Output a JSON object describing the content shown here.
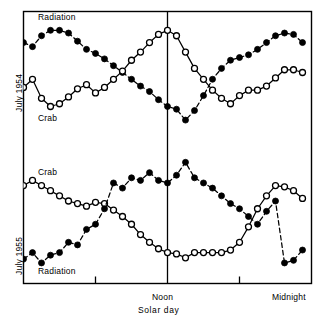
{
  "figure": {
    "xlabel": "Solar day",
    "axis_y_top": "July 1954",
    "axis_y_bottom": "July 1955",
    "tick_noon": "Noon",
    "tick_midnight": "Midnight",
    "label_radiation_1954": "Radiation",
    "label_crab_1954": "Crab",
    "label_crab_1955": "Crab",
    "label_radiation_1955": "Radiation",
    "colors": {
      "ink": "#000000",
      "background": "#ffffff"
    }
  },
  "chart_data": {
    "type": "line",
    "title": "",
    "subtitle": "",
    "xlabel": "Solar day",
    "ylabel": "",
    "grid": false,
    "legend": "inline-annotations",
    "xlim": [
      0,
      24
    ],
    "xticks": [
      6,
      12,
      18,
      24
    ],
    "xtick_labels": [
      "",
      "Noon",
      "",
      "Midnight"
    ],
    "noon_reference_line": 12,
    "panels": [
      {
        "name": "July 1954",
        "ylabel": "July 1954",
        "ylim": [
          0,
          100
        ],
        "series": [
          {
            "name": "Radiation",
            "marker": "filled-circle",
            "line": "dashed",
            "x": [
              0.0,
              0.75,
              1.5,
              2.25,
              3.0,
              3.75,
              4.5,
              5.25,
              6.0,
              6.75,
              7.5,
              8.25,
              9.0,
              9.75,
              10.5,
              11.25,
              12.0,
              12.75,
              13.5,
              14.25,
              15.0,
              15.75,
              16.5,
              17.25,
              18.0,
              18.75,
              19.5,
              20.25,
              21.0,
              21.75,
              22.5,
              23.25
            ],
            "y": [
              79,
              76,
              84,
              88,
              88,
              86,
              80,
              74,
              71,
              67,
              62,
              57,
              52,
              47,
              43,
              37,
              32,
              30,
              22,
              29,
              40,
              52,
              60,
              66,
              68,
              70,
              74,
              79,
              84,
              86,
              85,
              79
            ],
            "ylim": [
              0,
              100
            ]
          },
          {
            "name": "Crab",
            "marker": "open-circle",
            "line": "solid",
            "x": [
              0.0,
              0.75,
              1.5,
              2.25,
              3.0,
              3.75,
              4.5,
              5.25,
              6.0,
              6.75,
              7.5,
              8.25,
              9.0,
              9.75,
              10.5,
              11.25,
              12.0,
              12.75,
              13.5,
              14.25,
              15.0,
              15.75,
              16.5,
              17.25,
              18.0,
              18.75,
              19.5,
              20.25,
              21.0,
              21.75,
              22.5,
              23.25
            ],
            "y": [
              46,
              52,
              38,
              32,
              34,
              39,
              45,
              48,
              42,
              46,
              52,
              58,
              66,
              72,
              79,
              85,
              88,
              84,
              72,
              60,
              52,
              44,
              38,
              34,
              40,
              44,
              44,
              47,
              53,
              59,
              59,
              57
            ],
            "ylim": [
              0,
              100
            ]
          }
        ]
      },
      {
        "name": "July 1955",
        "ylabel": "July 1955",
        "ylim": [
          0,
          100
        ],
        "series": [
          {
            "name": "Crab",
            "marker": "open-circle",
            "line": "solid",
            "x": [
              0.0,
              0.75,
              1.5,
              2.25,
              3.0,
              3.75,
              4.5,
              5.25,
              6.0,
              6.75,
              7.5,
              8.25,
              9.0,
              9.75,
              10.5,
              11.25,
              12.0,
              12.75,
              13.5,
              14.25,
              15.0,
              15.75,
              16.5,
              17.25,
              18.0,
              18.75,
              19.5,
              20.25,
              21.0,
              21.75,
              22.5,
              23.25
            ],
            "y": [
              74,
              78,
              74,
              70,
              66,
              62,
              60,
              58,
              61,
              60,
              55,
              50,
              44,
              36,
              30,
              25,
              22,
              21,
              18,
              22,
              22,
              22,
              22,
              24,
              30,
              42,
              56,
              66,
              74,
              73,
              70,
              64
            ],
            "ylim": [
              0,
              100
            ]
          },
          {
            "name": "Radiation",
            "marker": "filled-circle",
            "line": "dashed",
            "x": [
              0.0,
              0.75,
              1.5,
              2.25,
              3.0,
              3.75,
              4.5,
              5.25,
              6.0,
              6.75,
              7.5,
              8.25,
              9.0,
              9.75,
              10.5,
              11.25,
              12.0,
              12.75,
              13.5,
              14.25,
              15.0,
              15.75,
              16.5,
              17.25,
              18.0,
              18.75,
              19.5,
              20.25,
              21.0,
              21.75,
              22.5,
              23.25
            ],
            "y": [
              17,
              22,
              14,
              20,
              22,
              30,
              28,
              40,
              44,
              56,
              76,
              72,
              80,
              78,
              84,
              78,
              76,
              82,
              92,
              80,
              76,
              72,
              66,
              60,
              56,
              50,
              44,
              54,
              62,
              14,
              16,
              24
            ],
            "ylim": [
              0,
              100
            ]
          }
        ]
      }
    ]
  }
}
